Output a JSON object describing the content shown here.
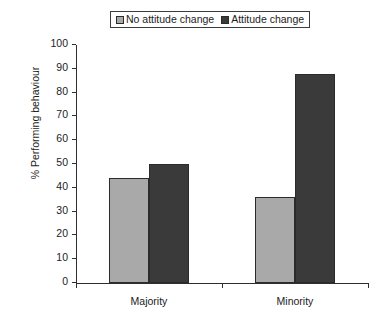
{
  "chart_data": {
    "type": "bar",
    "title": "",
    "xlabel": "",
    "ylabel": "% Performing behaviour",
    "categories": [
      "Majority",
      "Minority"
    ],
    "series": [
      {
        "name": "No attitude change",
        "values": [
          44,
          36
        ],
        "color": "#a9a9a9"
      },
      {
        "name": "Attitude change",
        "values": [
          50,
          88
        ],
        "color": "#3a3a3a"
      }
    ],
    "ylim": [
      0,
      100
    ],
    "ytick_step": 10,
    "yticks": [
      0,
      10,
      20,
      30,
      40,
      50,
      60,
      70,
      80,
      90,
      100
    ],
    "ytick_labels": [
      "0",
      "10",
      "20",
      "30",
      "40",
      "50",
      "60",
      "70",
      "80",
      "90",
      "100"
    ],
    "grid": false,
    "legend_position": "top-center"
  },
  "legend": {
    "entries": [
      {
        "label": "No attitude change",
        "swatch": "light"
      },
      {
        "label": "Attitude change",
        "swatch": "dark"
      }
    ]
  },
  "axes": {
    "y_axis_title": "% Performing behaviour"
  }
}
